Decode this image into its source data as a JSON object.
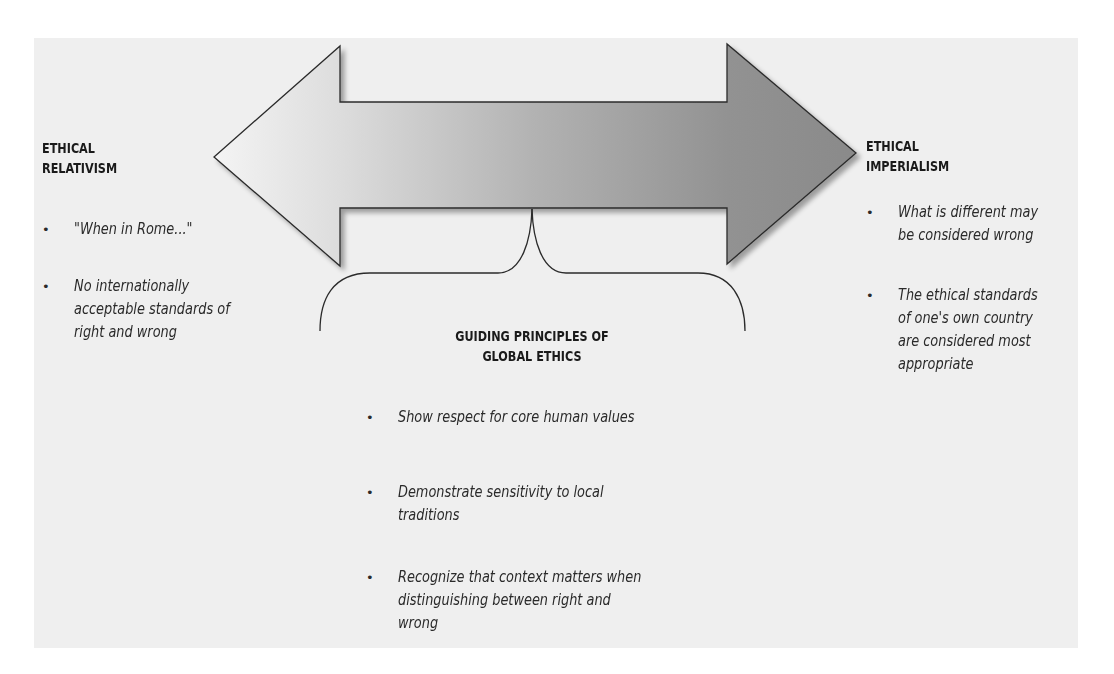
{
  "left": {
    "heading_line1": "ETHICAL",
    "heading_line2": "RELATIVISM",
    "items": [
      {
        "lines": [
          "\"When in Rome...\""
        ]
      },
      {
        "lines": [
          "No internationally",
          "acceptable standards of",
          "right and wrong"
        ]
      }
    ]
  },
  "right": {
    "heading_line1": "ETHICAL",
    "heading_line2": "IMPERIALISM",
    "items": [
      {
        "lines": [
          "What is different may",
          "be considered wrong"
        ]
      },
      {
        "lines": [
          "The ethical standards",
          "of one's own country",
          "are considered most",
          "appropriate"
        ]
      }
    ]
  },
  "center": {
    "heading_line1": "GUIDING PRINCIPLES OF",
    "heading_line2": "GLOBAL ETHICS",
    "items": [
      {
        "lines": [
          "Show respect for core human values"
        ]
      },
      {
        "lines": [
          "Demonstrate sensitivity to local",
          "traditions"
        ]
      },
      {
        "lines": [
          "Recognize that context matters when",
          "distinguishing between right and",
          "wrong"
        ]
      }
    ]
  },
  "icons": {
    "bullet": "•",
    "double_arrow": "double-headed-arrow",
    "brace": "curly-brace"
  },
  "colors": {
    "background": "#ffffff",
    "panel": "#efefef",
    "arrow_light": "#f2f2f2",
    "arrow_dark": "#8c8c8c",
    "outline": "#2b2b2b"
  }
}
